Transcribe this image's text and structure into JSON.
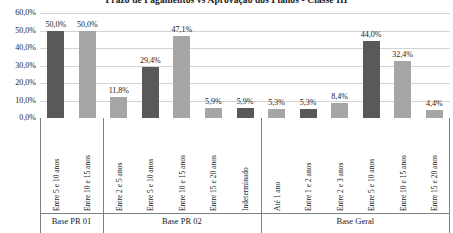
{
  "chart_data": {
    "type": "bar",
    "title": "Prazo de Pagamentos vs Aprovação dos Planos - Classe III",
    "xlabel": "",
    "ylabel": "",
    "ylim": [
      0,
      60
    ],
    "grid": true,
    "legend": "none",
    "ytick_labels": [
      "60,0%",
      "50,0%",
      "40,0%",
      "30,0%",
      "20,0%",
      "10,0%",
      "0,0%"
    ],
    "ytick_values": [
      60,
      50,
      40,
      30,
      20,
      10,
      0
    ],
    "categories": [
      "Entre 5 e 10 anos",
      "Entre 10 e 15 anos",
      "Entre 2 e 5 anos",
      "Entre 5 e 10 anos",
      "Entre 10 e 15 anos",
      "Entre 15 e 20 anos",
      "Indeterminado",
      "Até 1 ano",
      "Entre 1 e 2 anos",
      "Entre 2 e 3 anos",
      "Entre 5 e 10 anos",
      "Entre 10 e 15 anos",
      "Entre 15 e 20 anos"
    ],
    "values": [
      50.0,
      50.0,
      11.8,
      29.4,
      47.1,
      5.9,
      5.9,
      5.3,
      5.3,
      8.4,
      44.0,
      32.4,
      4.4
    ],
    "data_labels": [
      "50,0%",
      "50,0%",
      "11,8%",
      "29,4%",
      "47,1%",
      "5,9%",
      "5,9%",
      "5,3%",
      "5,3%",
      "8,4%",
      "44,0%",
      "32,4%",
      "4,4%"
    ],
    "bar_colors": [
      "#595959",
      "#a6a6a6",
      "#a6a6a6",
      "#595959",
      "#a6a6a6",
      "#a6a6a6",
      "#595959",
      "#a6a6a6",
      "#595959",
      "#a6a6a6",
      "#595959",
      "#a6a6a6",
      "#a6a6a6"
    ],
    "color_dark": "#595959",
    "color_light": "#a6a6a6",
    "groups": [
      {
        "label": "Base PR 01",
        "start_index": 0,
        "count": 2
      },
      {
        "label": "Base PR 02",
        "start_index": 2,
        "count": 5
      },
      {
        "label": "Base Geral",
        "start_index": 7,
        "count": 6
      }
    ]
  }
}
